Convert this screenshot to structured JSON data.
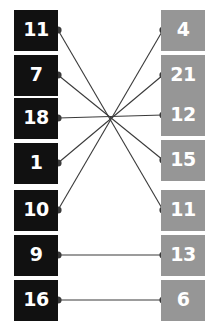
{
  "diagram": {
    "background_color": "#ffffff",
    "left_color": "#111111",
    "right_color": "#969696",
    "label_color": "#ffffff",
    "edge_color": "#3a3a3a"
  },
  "left_nodes": [
    {
      "label": "11",
      "y": 30
    },
    {
      "label": "7",
      "y": 75
    },
    {
      "label": "18",
      "y": 118
    },
    {
      "label": "1",
      "y": 163
    },
    {
      "label": "10",
      "y": 210
    },
    {
      "label": "9",
      "y": 255
    },
    {
      "label": "16",
      "y": 300
    }
  ],
  "right_nodes": [
    {
      "label": "4",
      "y": 30
    },
    {
      "label": "21",
      "y": 75
    },
    {
      "label": "12",
      "y": 115
    },
    {
      "label": "15",
      "y": 160
    },
    {
      "label": "11",
      "y": 210
    },
    {
      "label": "13",
      "y": 255
    },
    {
      "label": "6",
      "y": 300
    }
  ],
  "edges": [
    {
      "from": "11",
      "to": "11",
      "from_index": 0,
      "to_index": 4
    },
    {
      "from": "7",
      "to": "15",
      "from_index": 1,
      "to_index": 3
    },
    {
      "from": "18",
      "to": "12",
      "from_index": 2,
      "to_index": 2
    },
    {
      "from": "1",
      "to": "21",
      "from_index": 3,
      "to_index": 1
    },
    {
      "from": "10",
      "to": "4",
      "from_index": 4,
      "to_index": 0
    },
    {
      "from": "9",
      "to": "13",
      "from_index": 5,
      "to_index": 5
    },
    {
      "from": "16",
      "to": "6",
      "from_index": 6,
      "to_index": 6
    }
  ],
  "geometry": {
    "left_dot_x": 58,
    "right_dot_x": 163,
    "dot_radius": 3.6,
    "edge_width": 1.1
  }
}
